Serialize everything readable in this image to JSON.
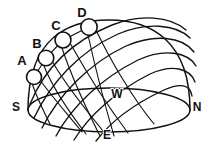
{
  "diagram": {
    "background_color": "#ffffff",
    "line_color": "#111111",
    "sun_fill_color": "#ffffff",
    "width": 210,
    "height": 150,
    "compass_labels": [
      {
        "id": "south",
        "text": "S",
        "x": 16,
        "y": 108
      },
      {
        "id": "west",
        "text": "W",
        "x": 117,
        "y": 95
      },
      {
        "id": "north",
        "text": "N",
        "x": 197,
        "y": 108
      },
      {
        "id": "east",
        "text": "E",
        "x": 107,
        "y": 136
      }
    ],
    "sun_positions": [
      {
        "id": "sun-a",
        "label": "A",
        "label_x": 22,
        "label_y": 62,
        "cx": 34,
        "cy": 77,
        "r": 7.5
      },
      {
        "id": "sun-b",
        "label": "B",
        "label_x": 37,
        "label_y": 45,
        "cx": 46,
        "cy": 58,
        "r": 7.8
      },
      {
        "id": "sun-c",
        "label": "C",
        "label_x": 56,
        "label_y": 27,
        "cx": 63,
        "cy": 40,
        "r": 8.0
      },
      {
        "id": "sun-d",
        "label": "D",
        "label_x": 82,
        "label_y": 14,
        "cx": 89,
        "cy": 27,
        "r": 8.2
      }
    ],
    "horizon": {
      "id": "horizon-ellipse",
      "cx": 109,
      "cy": 110,
      "rx": 81,
      "ry": 22
    },
    "dome": {
      "id": "dome-arc",
      "start_x": 28,
      "start_y": 110,
      "end_x": 190,
      "end_y": 110,
      "apex_y": 20
    },
    "sun_paths": [
      {
        "id": "sun-path-1",
        "d": "M 30 104 C 44 70 70 42 112 25 C 140 14 170 16 186 30"
      },
      {
        "id": "sun-path-2",
        "d": "M 34 118 C 50 84 78 52 118 34 C 146 22 176 24 190 38"
      },
      {
        "id": "sun-path-3",
        "d": "M 42 128 C 58 96 88 64 126 46 C 154 34 182 36 194 52"
      },
      {
        "id": "sun-path-4",
        "d": "M 56 136 C 72 106 102 78 138 60 C 164 48 188 52 196 66"
      },
      {
        "id": "sun-path-5",
        "d": "M 74 140 C 90 114 118 90 150 74 C 172 64 190 68 195 82"
      },
      {
        "id": "sun-path-6",
        "d": "M 96 141 C 112 120 138 102 164 90 C 180 83 190 84 192 96"
      }
    ],
    "converging_lines": [
      {
        "id": "converge-line-1",
        "d": "M 32 83 C 36 96 42 108 50 124"
      },
      {
        "id": "converge-line-2",
        "d": "M 40 80 C 50 94 64 110 82 132"
      },
      {
        "id": "converge-line-3",
        "d": "M 44 66 C 52 86 66 108 86 134"
      },
      {
        "id": "converge-line-4",
        "d": "M 52 61 C 64 82 84 108 108 137"
      },
      {
        "id": "converge-line-5",
        "d": "M 62 48 C 70 72 84 104 100 136"
      },
      {
        "id": "converge-line-6",
        "d": "M 70 43 C 84 68 106 104 128 133"
      },
      {
        "id": "converge-line-7",
        "d": "M 88 35 C 94 62 104 102 114 136"
      },
      {
        "id": "converge-line-8",
        "d": "M 96 30 C 110 60 134 100 154 124"
      }
    ],
    "sun_chain": {
      "id": "sun-chain-line",
      "d": "M 34 77 L 46 58 L 63 40 L 89 27"
    }
  }
}
